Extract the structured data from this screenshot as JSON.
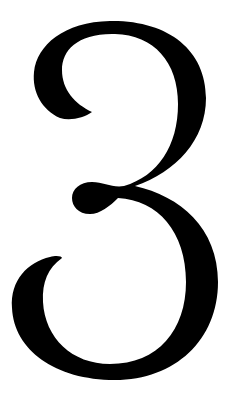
{
  "image": {
    "subject": "numeral",
    "glyph": "3",
    "style": "didone serif",
    "foreground_color": "#000000",
    "background_color": "#ffffff"
  }
}
